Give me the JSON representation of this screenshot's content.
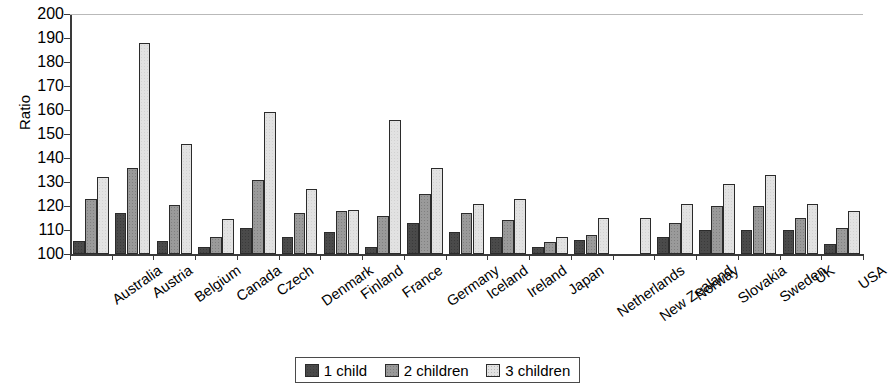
{
  "chart_data": {
    "type": "bar",
    "title": "",
    "xlabel": "",
    "ylabel": "Ratio",
    "ylim": [
      100,
      200
    ],
    "ytick_step": 10,
    "yticks": [
      200,
      190,
      180,
      170,
      160,
      150,
      140,
      130,
      120,
      110,
      100
    ],
    "grid": false,
    "legend_position": "bottom",
    "categories": [
      "Australia",
      "Austria",
      "Belgium",
      "Canada",
      "Czech",
      "Denmark",
      "Finland",
      "France",
      "Germany",
      "Iceland",
      "Ireland",
      "Japan",
      "Netherlands",
      "New Zealand",
      "Norway",
      "Slovakia",
      "Sweden",
      "UK",
      "USA"
    ],
    "series": [
      {
        "name": "1 child",
        "color": "#4a4a4a",
        "values": [
          105.5,
          117,
          105.5,
          103,
          111,
          107,
          109,
          103,
          113,
          109,
          107,
          103,
          106,
          null,
          107,
          110,
          110,
          110,
          104
        ]
      },
      {
        "name": "2 children",
        "color": "#9a9a9a",
        "values": [
          123,
          136,
          120.5,
          107,
          131,
          117,
          118,
          116,
          125,
          117,
          114,
          105,
          108,
          null,
          113,
          120,
          120,
          115,
          111
        ]
      },
      {
        "name": "3 children",
        "color": "#e2e2e2",
        "values": [
          132,
          188,
          146,
          114.5,
          159,
          127,
          118.5,
          156,
          136,
          121,
          123,
          107,
          115,
          115,
          121,
          129,
          133,
          121,
          118
        ]
      }
    ]
  },
  "legend": {
    "items": [
      {
        "label": "1 child"
      },
      {
        "label": "2 children"
      },
      {
        "label": "3 children"
      }
    ]
  }
}
